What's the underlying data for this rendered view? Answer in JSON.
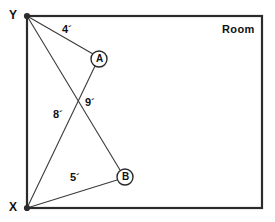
{
  "figure": {
    "title_label": "Room",
    "width_px": 275,
    "height_px": 222,
    "stroke_color": "#2b2b2b",
    "text_color": "#111111",
    "background_color": "#ffffff"
  },
  "corners": {
    "top_left": {
      "name": "Y",
      "label": "Y",
      "x": 27,
      "y": 16
    },
    "bottom_left": {
      "name": "X",
      "label": "X",
      "x": 27,
      "y": 208
    },
    "top_right": {
      "x": 262,
      "y": 16
    },
    "bottom_right": {
      "x": 262,
      "y": 208
    }
  },
  "points": [
    {
      "id": "A",
      "label": "A",
      "x": 99,
      "y": 59,
      "radius": 8
    },
    {
      "id": "B",
      "label": "B",
      "x": 125,
      "y": 177,
      "radius": 8
    }
  ],
  "segments": [
    {
      "from": "Y",
      "to": "A",
      "label": "4´",
      "label_x": 62,
      "label_y": 28
    },
    {
      "from": "Y",
      "to": "B",
      "label": "9´",
      "label_x": 85,
      "label_y": 101
    },
    {
      "from": "X",
      "to": "A",
      "label": "8´",
      "label_x": 53,
      "label_y": 113
    },
    {
      "from": "X",
      "to": "B",
      "label": "5´",
      "label_x": 70,
      "label_y": 176
    }
  ],
  "measurements": {
    "y_to_a": "4´",
    "y_to_b": "9´",
    "x_to_a": "8´",
    "x_to_b": "5´"
  }
}
